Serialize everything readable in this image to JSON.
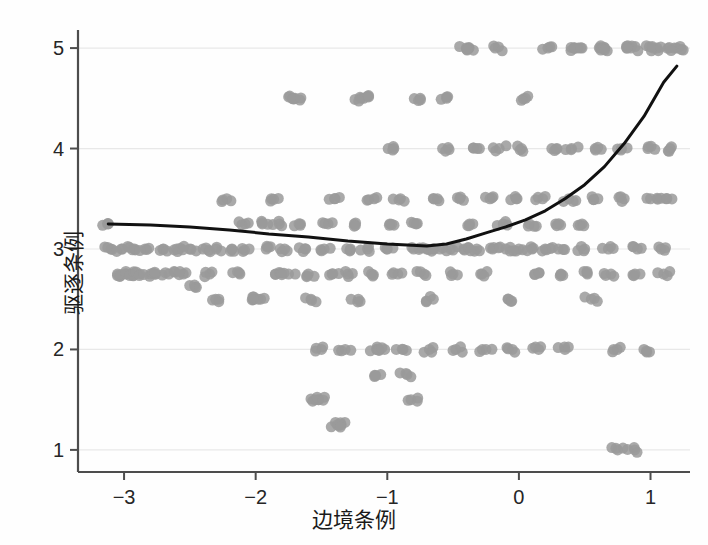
{
  "chart_data": {
    "type": "scatter",
    "title": "",
    "xlabel": "边境条例",
    "ylabel": "驱逐条例",
    "xlim": [
      -3.35,
      1.3
    ],
    "ylim": [
      0.78,
      5.18
    ],
    "xticks": [
      -3,
      -2,
      -1,
      0,
      1
    ],
    "xticklabels": [
      "−3",
      "−2",
      "−1",
      "0",
      "1"
    ],
    "yticks": [
      1,
      2,
      3,
      4,
      5
    ],
    "yticklabels": [
      "1",
      "2",
      "3",
      "4",
      "5"
    ],
    "grid": "horizontal-faint",
    "legend": "none",
    "point_color": "#9a9a9a",
    "point_opacity": 0.85,
    "point_radius": 5.5,
    "line_color": "#111111",
    "line_width": 3,
    "axis_color": "#4d4d4d",
    "background": "#fefefe",
    "series": [
      {
        "name": "观测值",
        "type": "scatter",
        "note": "离散评分带状散点（抖动），y 主要落在 1.0–5.0 的整数与半整数带上",
        "points": [
          [
            -3.12,
            3.25
          ],
          [
            -3.1,
            3.0
          ],
          [
            -3.05,
            2.75
          ],
          [
            -3.02,
            3.0
          ],
          [
            -2.98,
            2.75
          ],
          [
            -2.95,
            2.75
          ],
          [
            -2.92,
            3.0
          ],
          [
            -2.88,
            2.75
          ],
          [
            -2.84,
            3.0
          ],
          [
            -2.8,
            2.75
          ],
          [
            -2.76,
            2.75
          ],
          [
            -2.7,
            3.0
          ],
          [
            -2.66,
            2.75
          ],
          [
            -2.6,
            3.0
          ],
          [
            -2.55,
            2.75
          ],
          [
            -2.5,
            3.0
          ],
          [
            -2.46,
            2.62
          ],
          [
            -2.4,
            3.0
          ],
          [
            -2.35,
            2.75
          ],
          [
            -2.3,
            3.0
          ],
          [
            -2.28,
            2.5
          ],
          [
            -2.22,
            3.5
          ],
          [
            -2.18,
            3.0
          ],
          [
            -2.12,
            2.75
          ],
          [
            -2.08,
            3.25
          ],
          [
            -2.05,
            3.0
          ],
          [
            -2.02,
            2.5
          ],
          [
            -1.98,
            2.5
          ],
          [
            -1.95,
            3.25
          ],
          [
            -1.92,
            3.0
          ],
          [
            -1.88,
            3.5
          ],
          [
            -1.85,
            2.75
          ],
          [
            -1.82,
            3.25
          ],
          [
            -1.78,
            3.0
          ],
          [
            -1.75,
            2.75
          ],
          [
            -1.72,
            4.5
          ],
          [
            -1.7,
            4.5
          ],
          [
            -1.66,
            3.25
          ],
          [
            -1.62,
            3.0
          ],
          [
            -1.6,
            2.75
          ],
          [
            -1.58,
            2.5
          ],
          [
            -1.55,
            1.5
          ],
          [
            -1.52,
            1.5
          ],
          [
            -1.5,
            2.0
          ],
          [
            -1.48,
            3.0
          ],
          [
            -1.45,
            3.25
          ],
          [
            -1.42,
            2.75
          ],
          [
            -1.4,
            3.5
          ],
          [
            -1.38,
            1.25
          ],
          [
            -1.35,
            1.25
          ],
          [
            -1.32,
            2.0
          ],
          [
            -1.3,
            2.75
          ],
          [
            -1.28,
            3.0
          ],
          [
            -1.25,
            3.25
          ],
          [
            -1.22,
            2.5
          ],
          [
            -1.2,
            4.5
          ],
          [
            -1.18,
            4.5
          ],
          [
            -1.15,
            3.0
          ],
          [
            -1.12,
            2.75
          ],
          [
            -1.1,
            3.5
          ],
          [
            -1.08,
            2.0
          ],
          [
            -1.05,
            1.75
          ],
          [
            -1.02,
            2.0
          ],
          [
            -1.0,
            3.0
          ],
          [
            -0.98,
            3.25
          ],
          [
            -0.95,
            4.0
          ],
          [
            -0.92,
            2.75
          ],
          [
            -0.9,
            3.5
          ],
          [
            -0.88,
            2.0
          ],
          [
            -0.85,
            1.75
          ],
          [
            -0.82,
            1.5
          ],
          [
            -0.8,
            3.0
          ],
          [
            -0.78,
            3.25
          ],
          [
            -0.75,
            4.5
          ],
          [
            -0.72,
            2.75
          ],
          [
            -0.7,
            3.0
          ],
          [
            -0.68,
            2.0
          ],
          [
            -0.65,
            2.5
          ],
          [
            -0.62,
            3.5
          ],
          [
            -0.6,
            3.0
          ],
          [
            -0.58,
            4.0
          ],
          [
            -0.55,
            4.5
          ],
          [
            -0.52,
            3.0
          ],
          [
            -0.5,
            2.75
          ],
          [
            -0.48,
            2.0
          ],
          [
            -0.45,
            3.5
          ],
          [
            -0.42,
            3.0
          ],
          [
            -0.4,
            5.0
          ],
          [
            -0.38,
            5.0
          ],
          [
            -0.35,
            3.25
          ],
          [
            -0.32,
            3.0
          ],
          [
            -0.3,
            4.0
          ],
          [
            -0.28,
            2.75
          ],
          [
            -0.25,
            2.0
          ],
          [
            -0.22,
            3.5
          ],
          [
            -0.2,
            3.0
          ],
          [
            -0.18,
            5.0
          ],
          [
            -0.15,
            4.0
          ],
          [
            -0.12,
            3.25
          ],
          [
            -0.1,
            3.0
          ],
          [
            -0.08,
            2.5
          ],
          [
            -0.05,
            2.0
          ],
          [
            -0.02,
            3.5
          ],
          [
            0.0,
            3.0
          ],
          [
            0.02,
            4.0
          ],
          [
            0.05,
            4.5
          ],
          [
            0.08,
            3.25
          ],
          [
            0.1,
            3.0
          ],
          [
            0.12,
            2.75
          ],
          [
            0.15,
            2.0
          ],
          [
            0.18,
            3.5
          ],
          [
            0.2,
            3.0
          ],
          [
            0.22,
            5.0
          ],
          [
            0.25,
            4.0
          ],
          [
            0.28,
            3.25
          ],
          [
            0.3,
            3.0
          ],
          [
            0.32,
            2.75
          ],
          [
            0.35,
            2.0
          ],
          [
            0.38,
            3.5
          ],
          [
            0.4,
            4.0
          ],
          [
            0.42,
            5.0
          ],
          [
            0.45,
            5.0
          ],
          [
            0.48,
            3.25
          ],
          [
            0.5,
            3.0
          ],
          [
            0.52,
            2.75
          ],
          [
            0.55,
            2.5
          ],
          [
            0.58,
            4.0
          ],
          [
            0.6,
            3.5
          ],
          [
            0.62,
            5.0
          ],
          [
            0.65,
            5.0
          ],
          [
            0.68,
            3.0
          ],
          [
            0.7,
            2.75
          ],
          [
            0.72,
            2.0
          ],
          [
            0.75,
            1.0
          ],
          [
            0.78,
            4.0
          ],
          [
            0.8,
            3.5
          ],
          [
            0.82,
            5.0
          ],
          [
            0.85,
            5.0
          ],
          [
            0.88,
            1.0
          ],
          [
            0.9,
            3.0
          ],
          [
            0.92,
            2.75
          ],
          [
            0.95,
            2.0
          ],
          [
            0.98,
            4.0
          ],
          [
            1.0,
            3.5
          ],
          [
            1.02,
            5.0
          ],
          [
            1.05,
            5.0
          ],
          [
            1.08,
            3.0
          ],
          [
            1.1,
            2.75
          ],
          [
            1.12,
            3.5
          ],
          [
            1.15,
            4.0
          ],
          [
            1.18,
            5.0
          ],
          [
            1.2,
            5.0
          ]
        ]
      },
      {
        "name": "拟合曲线",
        "type": "line",
        "note": "LOESS/样条平滑曲线：左端约 3.25，在 x≈-0.7 处最低约 3.03，右端升至约 4.82",
        "x": [
          -3.12,
          -2.8,
          -2.5,
          -2.2,
          -1.9,
          -1.6,
          -1.3,
          -1.0,
          -0.85,
          -0.7,
          -0.55,
          -0.4,
          -0.25,
          -0.1,
          0.05,
          0.2,
          0.35,
          0.5,
          0.65,
          0.8,
          0.95,
          1.1,
          1.2
        ],
        "y": [
          3.25,
          3.24,
          3.22,
          3.19,
          3.15,
          3.12,
          3.08,
          3.05,
          3.04,
          3.03,
          3.05,
          3.1,
          3.16,
          3.22,
          3.29,
          3.38,
          3.5,
          3.64,
          3.82,
          4.05,
          4.32,
          4.66,
          4.82
        ]
      }
    ]
  }
}
